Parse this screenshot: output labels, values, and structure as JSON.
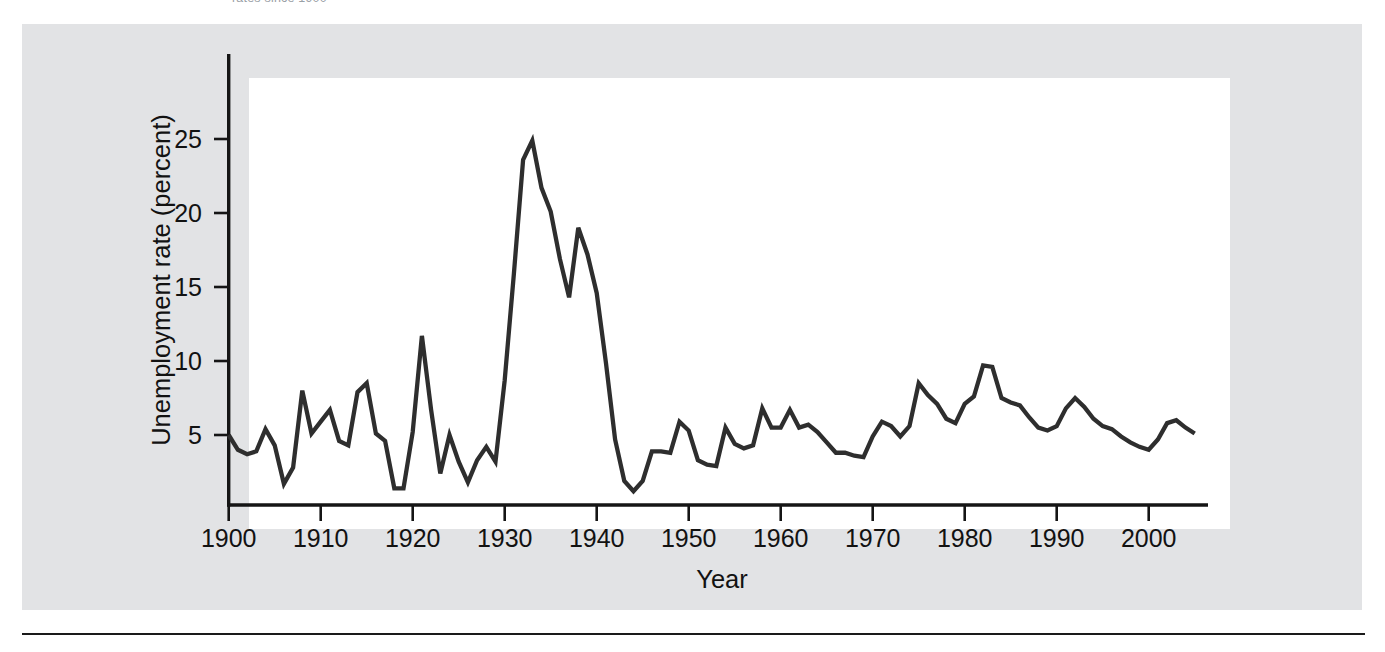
{
  "caption": {
    "clipped_text": "rates since 1900"
  },
  "colors": {
    "panel_background": "#e2e3e5",
    "plot_background": "#ffffff",
    "line": "#2e2e2e",
    "axis": "#151515",
    "text": "#121212"
  },
  "chart_data": {
    "type": "line",
    "title": "",
    "subtitle": "",
    "xlabel": "Year",
    "ylabel": "Unemployment rate (percent)",
    "xlim": [
      1900,
      2006
    ],
    "ylim": [
      0,
      28
    ],
    "xticks": [
      1900,
      1910,
      1920,
      1930,
      1940,
      1950,
      1960,
      1970,
      1980,
      1990,
      2000
    ],
    "xtick_labels": [
      "1900",
      "1910",
      "1920",
      "1930",
      "1940",
      "1950",
      "1960",
      "1970",
      "1980",
      "1990",
      "2000"
    ],
    "yticks": [
      5,
      10,
      15,
      20,
      25
    ],
    "ytick_labels": [
      "5",
      "10",
      "15",
      "20",
      "25"
    ],
    "grid": false,
    "legend": null,
    "legend_position": "none",
    "series": [
      {
        "name": "Unemployment rate",
        "x": [
          1900,
          1901,
          1902,
          1903,
          1904,
          1905,
          1906,
          1907,
          1908,
          1909,
          1910,
          1911,
          1912,
          1913,
          1914,
          1915,
          1916,
          1917,
          1918,
          1919,
          1920,
          1921,
          1922,
          1923,
          1924,
          1925,
          1926,
          1927,
          1928,
          1929,
          1930,
          1931,
          1932,
          1933,
          1934,
          1935,
          1936,
          1937,
          1938,
          1939,
          1940,
          1941,
          1942,
          1943,
          1944,
          1945,
          1946,
          1947,
          1948,
          1949,
          1950,
          1951,
          1952,
          1953,
          1954,
          1955,
          1956,
          1957,
          1958,
          1959,
          1960,
          1961,
          1962,
          1963,
          1964,
          1965,
          1966,
          1967,
          1968,
          1969,
          1970,
          1971,
          1972,
          1973,
          1974,
          1975,
          1976,
          1977,
          1978,
          1979,
          1980,
          1981,
          1982,
          1983,
          1984,
          1985,
          1986,
          1987,
          1988,
          1989,
          1990,
          1991,
          1992,
          1993,
          1994,
          1995,
          1996,
          1997,
          1998,
          1999,
          2000,
          2001,
          2002,
          2003,
          2004,
          2005
        ],
        "values": [
          5.0,
          4.0,
          3.7,
          3.9,
          5.4,
          4.3,
          1.7,
          2.8,
          8.0,
          5.1,
          5.9,
          6.7,
          4.6,
          4.3,
          7.9,
          8.5,
          5.1,
          4.6,
          1.4,
          1.4,
          5.2,
          11.7,
          6.7,
          2.4,
          5.0,
          3.2,
          1.8,
          3.3,
          4.2,
          3.2,
          8.7,
          15.9,
          23.6,
          24.9,
          21.7,
          20.1,
          16.9,
          14.3,
          19.0,
          17.2,
          14.6,
          9.9,
          4.7,
          1.9,
          1.2,
          1.9,
          3.9,
          3.9,
          3.8,
          5.9,
          5.3,
          3.3,
          3.0,
          2.9,
          5.5,
          4.4,
          4.1,
          4.3,
          6.8,
          5.5,
          5.5,
          6.7,
          5.5,
          5.7,
          5.2,
          4.5,
          3.8,
          3.8,
          3.6,
          3.5,
          4.9,
          5.9,
          5.6,
          4.9,
          5.6,
          8.5,
          7.7,
          7.1,
          6.1,
          5.8,
          7.1,
          7.6,
          9.7,
          9.6,
          7.5,
          7.2,
          7.0,
          6.2,
          5.5,
          5.3,
          5.6,
          6.8,
          7.5,
          6.9,
          6.1,
          5.6,
          5.4,
          4.9,
          4.5,
          4.2,
          4.0,
          4.7,
          5.8,
          6.0,
          5.5,
          5.1
        ]
      }
    ]
  }
}
